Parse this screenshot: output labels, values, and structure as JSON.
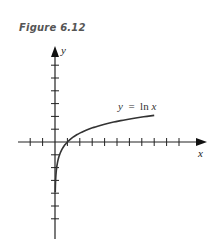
{
  "figure": {
    "title": "Figure 6.12"
  },
  "chart_data": {
    "type": "line",
    "title": "Figure 6.12",
    "xlabel": "x",
    "ylabel": "y",
    "series": [
      {
        "name": "y = ln x",
        "x": [
          0.02,
          0.05,
          0.1,
          0.2,
          0.5,
          1,
          2,
          3,
          4,
          5,
          6,
          7,
          8
        ],
        "values": [
          -3.91,
          -3.0,
          -2.3,
          -1.61,
          -0.69,
          0,
          0.69,
          1.1,
          1.39,
          1.61,
          1.79,
          1.95,
          2.08
        ]
      }
    ],
    "annotations": [
      "y = ln x"
    ],
    "xlim": [
      -2,
      12
    ],
    "ylim": [
      -7,
      7
    ],
    "x_ticks": [
      -2,
      -1,
      1,
      2,
      3,
      4,
      5,
      6,
      7,
      8,
      9,
      10
    ],
    "y_ticks": [
      -6,
      -5,
      -4,
      -3,
      -2,
      -1,
      1,
      2,
      3,
      4,
      5,
      6
    ],
    "tick_labels": "none",
    "grid": false,
    "legend": "none"
  },
  "labels": {
    "x_axis": "x",
    "y_axis": "y",
    "curve_label": "y  =  ln x"
  },
  "colors": {
    "axis": "#222222",
    "curve": "#333333",
    "title": "#555555"
  }
}
